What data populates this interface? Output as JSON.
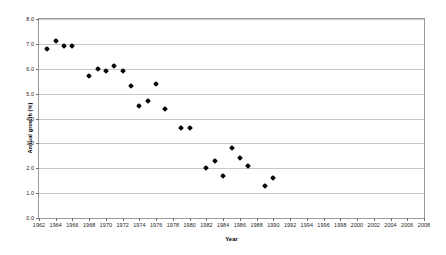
{
  "chart_data": {
    "type": "scatter",
    "title": "",
    "xlabel": "Year",
    "ylabel": "Annual growth (%)",
    "xlim": [
      1962,
      2008
    ],
    "ylim": [
      0.0,
      8.0
    ],
    "grid": true,
    "legend": "none",
    "xticks": [
      1962,
      1964,
      1966,
      1968,
      1970,
      1972,
      1974,
      1976,
      1978,
      1980,
      1982,
      1984,
      1986,
      1988,
      1990,
      1992,
      1994,
      1996,
      1998,
      2000,
      2002,
      2004,
      2006,
      2008
    ],
    "xtick_labels": [
      "1962",
      "1964",
      "1966",
      "1968",
      "1970",
      "1972",
      "1974",
      "1976",
      "1978",
      "1980",
      "1982",
      "1984",
      "1986",
      "1988",
      "1990",
      "1992",
      "1994",
      "1996",
      "1998",
      "2000",
      "2002",
      "2004",
      "2006",
      "2008"
    ],
    "yticks": [
      0.0,
      1.0,
      2.0,
      3.0,
      4.0,
      5.0,
      6.0,
      7.0,
      8.0
    ],
    "ytick_labels": [
      "0.0",
      "1.0",
      "2.0",
      "3.0",
      "4.0",
      "5.0",
      "6.0",
      "7.0",
      "8.0"
    ],
    "marker": "diamond",
    "marker_color": "#000000",
    "x": [
      1963,
      1964,
      1965,
      1966,
      1968,
      1969,
      1970,
      1971,
      1972,
      1973,
      1974,
      1975,
      1976,
      1977,
      1979,
      1980,
      1982,
      1983,
      1984,
      1985,
      1986,
      1987,
      1989,
      1990
    ],
    "y": [
      6.8,
      7.1,
      6.9,
      6.9,
      5.7,
      6.0,
      5.9,
      6.1,
      5.9,
      5.3,
      4.5,
      4.7,
      5.4,
      4.4,
      3.6,
      3.6,
      2.0,
      2.3,
      1.7,
      2.8,
      2.4,
      2.1,
      1.3,
      1.6
    ],
    "points": [
      {
        "x": 1963,
        "y": 6.8
      },
      {
        "x": 1964,
        "y": 7.1
      },
      {
        "x": 1965,
        "y": 6.9
      },
      {
        "x": 1966,
        "y": 6.9
      },
      {
        "x": 1968,
        "y": 5.7
      },
      {
        "x": 1969,
        "y": 6.0
      },
      {
        "x": 1970,
        "y": 5.9
      },
      {
        "x": 1971,
        "y": 6.1
      },
      {
        "x": 1972,
        "y": 5.9
      },
      {
        "x": 1973,
        "y": 5.3
      },
      {
        "x": 1974,
        "y": 4.5
      },
      {
        "x": 1975,
        "y": 4.7
      },
      {
        "x": 1976,
        "y": 5.4
      },
      {
        "x": 1977,
        "y": 4.4
      },
      {
        "x": 1979,
        "y": 3.6
      },
      {
        "x": 1980,
        "y": 3.6
      },
      {
        "x": 1982,
        "y": 2.0
      },
      {
        "x": 1983,
        "y": 2.3
      },
      {
        "x": 1984,
        "y": 1.7
      },
      {
        "x": 1985,
        "y": 2.8
      },
      {
        "x": 1986,
        "y": 2.4
      },
      {
        "x": 1987,
        "y": 2.1
      },
      {
        "x": 1989,
        "y": 1.3
      },
      {
        "x": 1990,
        "y": 1.6
      }
    ]
  },
  "style": {
    "plot_border_color": "#9a9a9a",
    "gridline_color": "#c8c8c8",
    "background": "#ffffff",
    "text_color": "#1a1a1a"
  }
}
